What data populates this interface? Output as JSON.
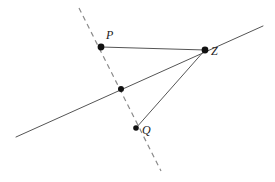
{
  "figure": {
    "type": "geometry-diagram",
    "width": 275,
    "height": 182,
    "background_color": "#ffffff"
  },
  "labels": {
    "p": "P",
    "q": "Q",
    "z": "Z"
  },
  "colors": {
    "solid_line": "#555555",
    "dashed_line": "#8a8a8a",
    "segment": "#555555",
    "point_fill": "#111111",
    "label_text": "#1a1a1a"
  },
  "points": [
    {
      "name": "P",
      "label": "P",
      "x": 101,
      "y": 47,
      "radius": 3.4,
      "label_x": 106,
      "label_y": 29
    },
    {
      "name": "M",
      "label": "",
      "x": 121,
      "y": 89,
      "radius": 3.0,
      "label_x": 0,
      "label_y": 0
    },
    {
      "name": "Q",
      "label": "Q",
      "x": 136,
      "y": 128,
      "radius": 2.8,
      "label_x": 142,
      "label_y": 124
    },
    {
      "name": "Z",
      "label": "Z",
      "x": 205,
      "y": 50,
      "radius": 3.4,
      "label_x": 211,
      "label_y": 45
    }
  ],
  "lines": {
    "dashed_transversal": {
      "name": "dashed-transversal",
      "style": "dashed",
      "x1": 79,
      "y1": 8,
      "x2": 161,
      "y2": 171,
      "dash_pattern": "5,4",
      "width": 1.2
    },
    "solid_ray": {
      "name": "solid-ray",
      "style": "solid",
      "x1": 16,
      "y1": 137,
      "x2": 263,
      "y2": 26,
      "width": 1.0
    },
    "segment_pz": {
      "name": "segment-p-z",
      "style": "solid",
      "x1": 101,
      "y1": 47,
      "x2": 205,
      "y2": 50,
      "width": 1.0
    },
    "segment_qz": {
      "name": "segment-q-z",
      "style": "solid",
      "x1": 136,
      "y1": 128,
      "x2": 205,
      "y2": 50,
      "width": 1.0
    }
  }
}
